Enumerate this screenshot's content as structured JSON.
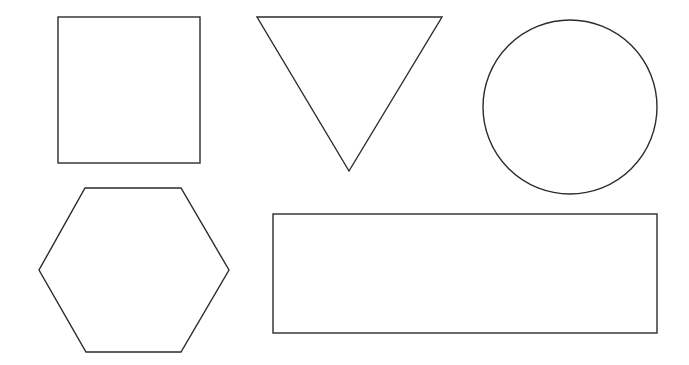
{
  "canvas": {
    "width": 689,
    "height": 365,
    "background": "#ffffff",
    "stroke_color": "#2b2b2b"
  },
  "shapes": [
    {
      "name": "square",
      "type": "rect",
      "x": 58,
      "y": 17,
      "width": 142,
      "height": 146
    },
    {
      "name": "triangle",
      "type": "polygon",
      "points": "257,17 442,17 349,171"
    },
    {
      "name": "circle",
      "type": "circle",
      "cx": 570,
      "cy": 107,
      "r": 87
    },
    {
      "name": "hexagon",
      "type": "polygon",
      "points": "85,188 181,188 229,270 181,352 86,352 39,270"
    },
    {
      "name": "rectangle",
      "type": "rect",
      "x": 273,
      "y": 214,
      "width": 384,
      "height": 119
    }
  ]
}
